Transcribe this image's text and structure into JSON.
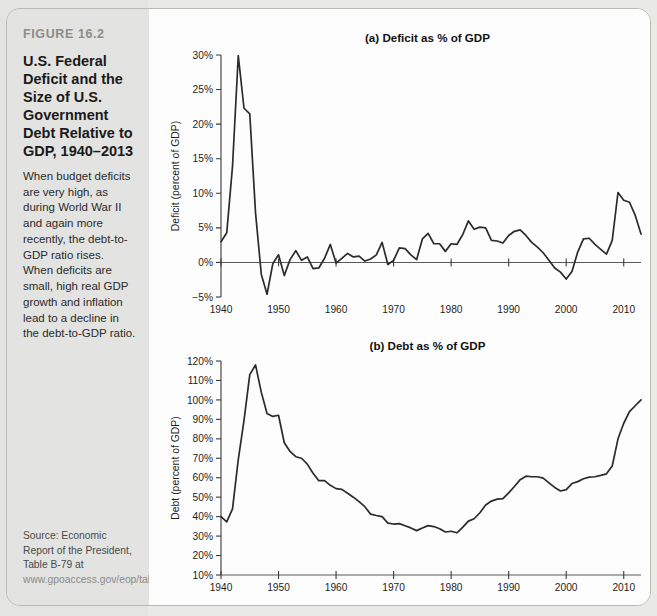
{
  "figure": {
    "number": "FIGURE 16.2",
    "title": "U.S. Federal Deficit and the Size of U.S. Government Debt Relative to GDP, 1940–2013",
    "description": "When budget deficits are very high, as during World War II and again more recently, the debt-to-GDP ratio rises. When deficits are small, high real GDP growth and inflation lead to a decline in the debt-to-GDP ratio.",
    "source_prefix": "Source: Economic Report of the President, Table B-79 at ",
    "source_url": "www.gpoaccess.gov/eop/tables09.html"
  },
  "colors": {
    "line": "#2b2b2b",
    "axis": "#3a3a3a",
    "rail_background": "#e3e3e1",
    "panel_background": "#fdfdfd",
    "figure_number": "#8d8d8a"
  },
  "chart_data": [
    {
      "id": "deficit",
      "type": "line",
      "title": "(a) Deficit as % of GDP",
      "xlabel": "",
      "ylabel": "Deficit (percent of GDP)",
      "xlim": [
        1940,
        2013
      ],
      "ylim": [
        -5,
        30
      ],
      "xticks": [
        1940,
        1950,
        1960,
        1970,
        1980,
        1990,
        2000,
        2010
      ],
      "xtick_labels": [
        "1940",
        "1950",
        "1960",
        "1970",
        "1980",
        "1990",
        "2000",
        "2010"
      ],
      "yticks": [
        -5,
        0,
        5,
        10,
        15,
        20,
        25,
        30
      ],
      "ytick_labels": [
        "−5%",
        "0%",
        "5%",
        "10%",
        "15%",
        "20%",
        "25%",
        "30%"
      ],
      "grid": false,
      "legend": "none",
      "x": [
        1940,
        1941,
        1942,
        1943,
        1944,
        1945,
        1946,
        1947,
        1948,
        1949,
        1950,
        1951,
        1952,
        1953,
        1954,
        1955,
        1956,
        1957,
        1958,
        1959,
        1960,
        1961,
        1962,
        1963,
        1964,
        1965,
        1966,
        1967,
        1968,
        1969,
        1970,
        1971,
        1972,
        1973,
        1974,
        1975,
        1976,
        1977,
        1978,
        1979,
        1980,
        1981,
        1982,
        1983,
        1984,
        1985,
        1986,
        1987,
        1988,
        1989,
        1990,
        1991,
        1992,
        1993,
        1994,
        1995,
        1996,
        1997,
        1998,
        1999,
        2000,
        2001,
        2002,
        2003,
        2004,
        2005,
        2006,
        2007,
        2008,
        2009,
        2010,
        2011,
        2012,
        2013
      ],
      "values": [
        3.0,
        4.3,
        13.9,
        29.9,
        22.3,
        21.5,
        7.2,
        -1.7,
        -4.6,
        -0.2,
        1.1,
        -1.9,
        0.4,
        1.7,
        0.3,
        0.8,
        -0.9,
        -0.8,
        0.6,
        2.6,
        -0.1,
        0.6,
        1.3,
        0.8,
        0.9,
        0.2,
        0.5,
        1.1,
        2.9,
        -0.3,
        0.3,
        2.1,
        2.0,
        1.1,
        0.4,
        3.4,
        4.2,
        2.7,
        2.7,
        1.6,
        2.7,
        2.6,
        4.0,
        6.0,
        4.8,
        5.1,
        5.0,
        3.2,
        3.1,
        2.8,
        3.9,
        4.5,
        4.7,
        3.9,
        2.9,
        2.2,
        1.4,
        0.3,
        -0.8,
        -1.4,
        -2.4,
        -1.3,
        1.5,
        3.4,
        3.5,
        2.6,
        1.9,
        1.2,
        3.2,
        10.1,
        9.0,
        8.7,
        6.8,
        4.1
      ]
    },
    {
      "id": "debt",
      "type": "line",
      "title": "(b) Debt as % of GDP",
      "xlabel": "",
      "ylabel": "Debt (percent of GDP)",
      "xlim": [
        1940,
        2013
      ],
      "ylim": [
        10,
        120
      ],
      "xticks": [
        1940,
        1950,
        1960,
        1970,
        1980,
        1990,
        2000,
        2010
      ],
      "xtick_labels": [
        "1940",
        "1950",
        "1960",
        "1970",
        "1980",
        "1990",
        "2000",
        "2010"
      ],
      "yticks": [
        10,
        20,
        30,
        40,
        50,
        60,
        70,
        80,
        90,
        100,
        110,
        120
      ],
      "ytick_labels": [
        "10%",
        "20%",
        "30%",
        "40%",
        "50%",
        "60%",
        "70%",
        "80%",
        "90%",
        "100%",
        "110%",
        "120%"
      ],
      "grid": false,
      "legend": "none",
      "x": [
        1940,
        1941,
        1942,
        1943,
        1944,
        1945,
        1946,
        1947,
        1948,
        1949,
        1950,
        1951,
        1952,
        1953,
        1954,
        1955,
        1956,
        1957,
        1958,
        1959,
        1960,
        1961,
        1962,
        1963,
        1964,
        1965,
        1966,
        1967,
        1968,
        1969,
        1970,
        1971,
        1972,
        1973,
        1974,
        1975,
        1976,
        1977,
        1978,
        1979,
        1980,
        1981,
        1982,
        1983,
        1984,
        1985,
        1986,
        1987,
        1988,
        1989,
        1990,
        1991,
        1992,
        1993,
        1994,
        1995,
        1996,
        1997,
        1998,
        1999,
        2000,
        2001,
        2002,
        2003,
        2004,
        2005,
        2006,
        2007,
        2008,
        2009,
        2010,
        2011,
        2012,
        2013
      ],
      "values": [
        40.0,
        37.3,
        44.0,
        69.3,
        89.5,
        113.0,
        118.0,
        104.0,
        93.0,
        91.5,
        92.1,
        78.0,
        73.5,
        70.8,
        70.0,
        67.0,
        62.3,
        58.5,
        58.5,
        56.1,
        54.4,
        54.0,
        52.0,
        50.0,
        47.7,
        45.1,
        41.3,
        40.6,
        40.0,
        36.7,
        36.2,
        36.4,
        35.3,
        34.2,
        32.8,
        34.2,
        35.4,
        34.9,
        33.8,
        32.1,
        32.5,
        31.7,
        34.5,
        37.7,
        38.9,
        42.0,
        46.0,
        48.0,
        49.0,
        49.3,
        52.2,
        55.5,
        59.0,
        60.8,
        60.5,
        60.5,
        59.8,
        57.4,
        55.0,
        53.2,
        53.9,
        57.0,
        58.0,
        59.5,
        60.3,
        60.5,
        61.2,
        62.0,
        66.0,
        80.0,
        88.0,
        94.0,
        97.0,
        100.0
      ]
    }
  ]
}
